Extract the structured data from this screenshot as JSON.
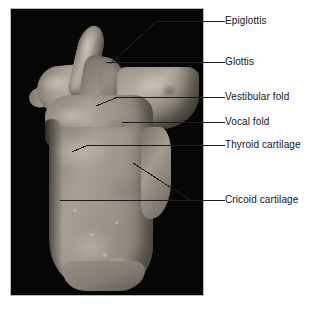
{
  "figure": {
    "photo": {
      "subject": "dissected human larynx, posterior view",
      "background_color": "#050505",
      "specimen_color": "#9a9287",
      "frame_border_color": "#b8b8b8"
    },
    "label_color": "#141414",
    "leader_color": "#1c1c1c",
    "labels": [
      {
        "id": "epiglottis",
        "text": "Epiglottis",
        "text_x": 225,
        "text_y": 15,
        "leader": "M 225 21 L 157 21 L 110 64"
      },
      {
        "id": "glottis",
        "text": "Glottis",
        "text_x": 225,
        "text_y": 56,
        "leader": "M 225 62 L 106 62"
      },
      {
        "id": "vestibular-fold",
        "text": "Vestibular fold",
        "text_x": 225,
        "text_y": 91,
        "leader": "M 225 97 L 118 97 L 96 106"
      },
      {
        "id": "vocal-fold",
        "text": "Vocal fold",
        "text_x": 225,
        "text_y": 116,
        "leader": "M 225 122 L 122 122"
      },
      {
        "id": "thyroid-cartilage",
        "text": "Thyroid cartilage",
        "text_x": 225,
        "text_y": 139,
        "leader": "M 225 145 L 88 145 L 72 152"
      },
      {
        "id": "cricoid-cartilage",
        "text": "Cricoid cartilage",
        "text_x": 225,
        "text_y": 194,
        "leader": "M 225 200 L 190 200 L 133 163"
      },
      {
        "id": "thyroid-cartilage-lower-leader",
        "text": "",
        "text_x": 0,
        "text_y": 0,
        "leader": "M 190 200 L 60 200"
      }
    ]
  }
}
